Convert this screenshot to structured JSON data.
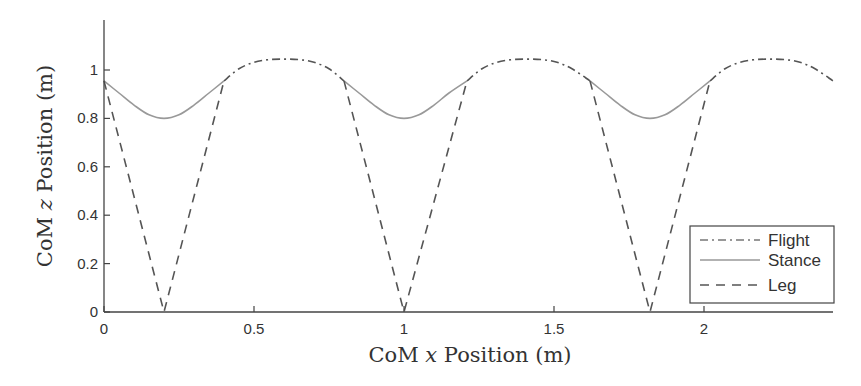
{
  "chart_data": {
    "type": "line",
    "title": "",
    "xlabel": "CoM x Position (m)",
    "ylabel": "CoM z Position (m)",
    "xlabel_parts": {
      "pre": "CoM ",
      "var": "x",
      "post": " Position (m)"
    },
    "ylabel_parts": {
      "pre": "CoM ",
      "var": "z",
      "post": " Position (m)"
    },
    "xlim": [
      0,
      2.43
    ],
    "ylim": [
      0,
      1.2
    ],
    "xticks": [
      0,
      0.5,
      1,
      1.5,
      2
    ],
    "xtick_labels": [
      "0",
      "0.5",
      "1",
      "1.5",
      "2"
    ],
    "yticks": [
      0,
      0.2,
      0.4,
      0.6,
      0.8,
      1
    ],
    "ytick_labels": [
      "0",
      "0.2",
      "0.4",
      "0.6",
      "0.8",
      "1"
    ],
    "grid": false,
    "legend_position": "lower right",
    "series": [
      {
        "name": "Flight",
        "style": "dash-dot",
        "color": "#555555",
        "segments": [
          {
            "x": [
              0.4,
              0.45,
              0.5,
              0.55,
              0.6,
              0.65,
              0.7,
              0.75,
              0.8
            ],
            "y": [
              0.955,
              1.005,
              1.032,
              1.043,
              1.045,
              1.043,
              1.032,
              1.005,
              0.955
            ]
          },
          {
            "x": [
              1.21,
              1.26,
              1.31,
              1.36,
              1.41,
              1.46,
              1.51,
              1.56,
              1.62
            ],
            "y": [
              0.955,
              1.005,
              1.032,
              1.043,
              1.045,
              1.043,
              1.032,
              1.005,
              0.955
            ]
          },
          {
            "x": [
              2.02,
              2.07,
              2.12,
              2.17,
              2.22,
              2.27,
              2.32,
              2.37,
              2.43
            ],
            "y": [
              0.955,
              1.005,
              1.032,
              1.043,
              1.045,
              1.043,
              1.032,
              1.005,
              0.955
            ]
          }
        ]
      },
      {
        "name": "Stance",
        "style": "solid",
        "color": "#999999",
        "segments": [
          {
            "x": [
              0.0,
              0.05,
              0.1,
              0.15,
              0.2,
              0.25,
              0.3,
              0.35,
              0.4
            ],
            "y": [
              0.955,
              0.905,
              0.855,
              0.815,
              0.8,
              0.815,
              0.855,
              0.905,
              0.955
            ]
          },
          {
            "x": [
              0.8,
              0.85,
              0.9,
              0.95,
              1.0,
              1.05,
              1.1,
              1.15,
              1.21
            ],
            "y": [
              0.955,
              0.905,
              0.855,
              0.815,
              0.8,
              0.815,
              0.855,
              0.905,
              0.955
            ]
          },
          {
            "x": [
              1.62,
              1.67,
              1.72,
              1.77,
              1.82,
              1.87,
              1.92,
              1.97,
              2.02
            ],
            "y": [
              0.955,
              0.905,
              0.855,
              0.815,
              0.8,
              0.815,
              0.855,
              0.905,
              0.955
            ]
          }
        ]
      },
      {
        "name": "Leg",
        "style": "dashed",
        "color": "#555555",
        "segments": [
          {
            "x": [
              0.0,
              0.2,
              0.4
            ],
            "y": [
              0.955,
              0.0,
              0.955
            ]
          },
          {
            "x": [
              0.8,
              1.0,
              1.21
            ],
            "y": [
              0.955,
              0.0,
              0.955
            ]
          },
          {
            "x": [
              1.62,
              1.82,
              2.02
            ],
            "y": [
              0.955,
              0.0,
              0.955
            ]
          }
        ]
      }
    ],
    "legend": [
      {
        "label": "Flight",
        "style": "dash-dot"
      },
      {
        "label": "Stance",
        "style": "solid"
      },
      {
        "label": "Leg",
        "style": "dashed"
      }
    ]
  },
  "layout": {
    "origin_px": [
      104,
      312
    ],
    "px_per_x": 300,
    "px_per_y": 242,
    "x_axis_end_px": 833,
    "y_axis_top_px": 20
  }
}
